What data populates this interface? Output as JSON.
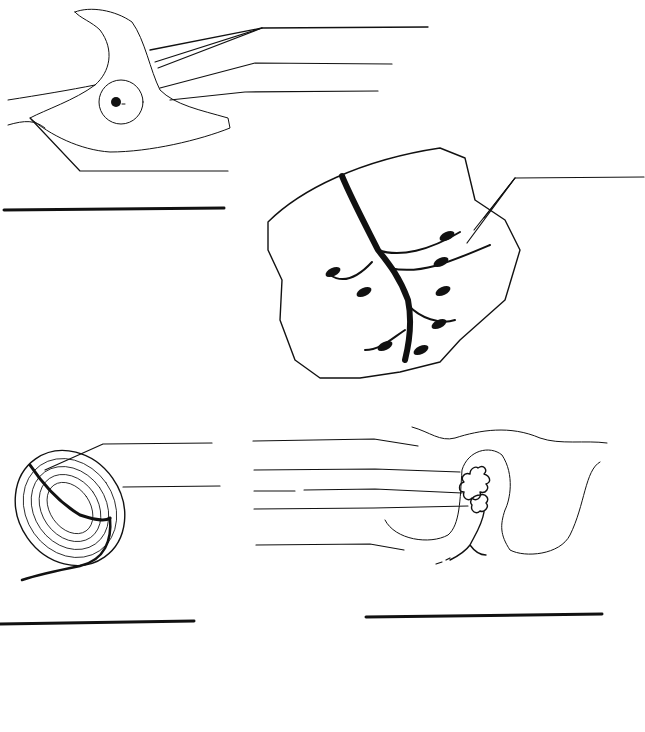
{
  "worksheet": {
    "type": "blank labeling worksheet",
    "ink_color": "#111111",
    "background_color": "#ffffff",
    "diagrams": [
      {
        "id": "diagram-1",
        "subject": "smooth-muscle-like cell with nucleus in dense stippled matrix",
        "title_slot": "",
        "label_slots": [
          "",
          "",
          "",
          ""
        ]
      },
      {
        "id": "diagram-2",
        "subject": "cardiac muscle fibers with branching dark band and nuclei",
        "title_slot": "",
        "label_slots": [
          ""
        ]
      },
      {
        "id": "diagram-3",
        "subject": "encapsulated corpuscle with layered lamellae and nerve fiber",
        "title_slot": "",
        "label_slots": [
          "",
          ""
        ]
      },
      {
        "id": "diagram-4",
        "subject": "coiled nerve ending inside capsule in tissue fold",
        "title_slot": "",
        "label_slots": [
          "",
          "",
          "",
          "",
          ""
        ]
      }
    ]
  }
}
